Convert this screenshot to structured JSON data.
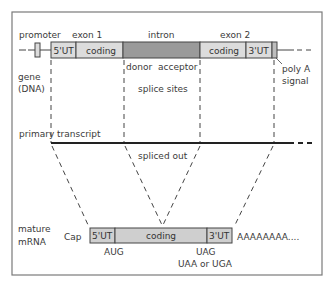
{
  "colors": {
    "frame": "#7a7a7a",
    "light_box": "#dcdcdc",
    "intron_box": "#9a9a9a",
    "mrna_box": "#cfcfcf",
    "line": "#222222",
    "dash": "#444444",
    "text": "#3a3a3a"
  },
  "gene": {
    "promoter_label": "promoter",
    "exon1_label": "exon 1",
    "intron_label": "intron",
    "exon2_label": "exon 2",
    "gene_label_line1": "gene",
    "gene_label_line2": "(DNA)",
    "segments": {
      "utr5": "5'UT",
      "coding1": "coding",
      "coding2": "coding",
      "utr3": "3'UT"
    },
    "donor_label": "donor",
    "acceptor_label": "acceptor",
    "splice_sites_label": "splice sites",
    "poly_a_line1": "poly A",
    "poly_a_line2": "signal"
  },
  "primary_transcript": {
    "label": "primary transcript",
    "spliced_out_label": "spliced out"
  },
  "mature_mrna": {
    "label_line1": "mature",
    "label_line2": "mRNA",
    "cap_label": "Cap",
    "segments": {
      "utr5": "5'UT",
      "coding": "coding",
      "utr3": "3'UT"
    },
    "poly_a_tail": "AAAAAAAA....",
    "start_codon": "AUG",
    "stop_codon_line1": "UAG",
    "stop_codon_line2": "UAA or UGA"
  }
}
